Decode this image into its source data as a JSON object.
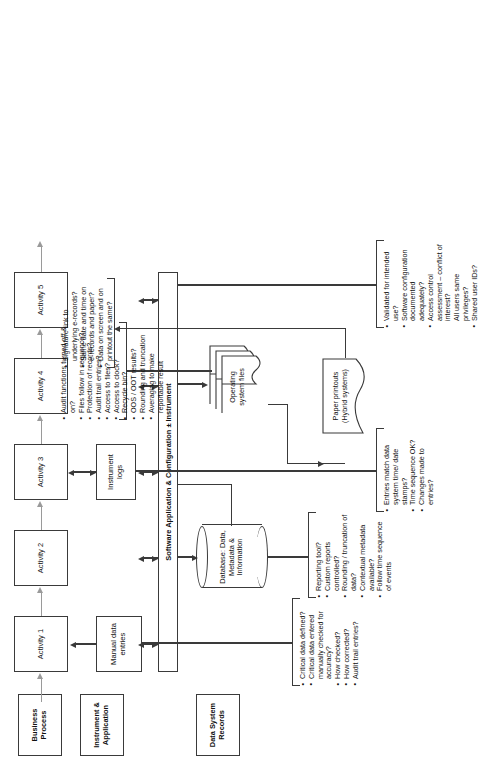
{
  "diagram": {
    "orientation": "rotated-90-ccw"
  },
  "lanes": [
    {
      "id": "business-process",
      "label": "Business Process"
    },
    {
      "id": "instrument-application",
      "label": "Instrument & Application"
    },
    {
      "id": "data-system-records",
      "label": "Data System Records"
    }
  ],
  "activities": [
    {
      "id": "activity-1",
      "label": "Activity 1"
    },
    {
      "id": "activity-2",
      "label": "Activity 2"
    },
    {
      "id": "activity-3",
      "label": "Activity 3"
    },
    {
      "id": "activity-4",
      "label": "Activity 4"
    },
    {
      "id": "activity-5",
      "label": "Activity 5"
    }
  ],
  "nodes": {
    "manual_data_entries": "Manual data entries",
    "instrument_logs": "Instrument logs",
    "software_bar": "Software Application & Configuration ± Instrument",
    "database": "Database: Data, Metadata & Information",
    "os_files": "Operating system files",
    "paper_printouts": "Paper printouts (Hybrid systems)"
  },
  "callouts": {
    "manual_entries": {
      "id": "callout-manual-entries",
      "items": [
        "Critical data defined?",
        "Critical data entered manually checked for accuracy?",
        "How checked?",
        "How corrected?",
        "Audit trail entries?"
      ]
    },
    "instrument_logs": {
      "id": "callout-instrument-logs",
      "items": [
        "Entries match data system time/ date stamps?",
        "Time sequence OK?",
        "Changes made to entries?"
      ]
    },
    "software": {
      "id": "callout-software",
      "items": [
        "Validated for intended use?",
        "Software configuration documented adequately?",
        "Access control assessment – conflict of interest?",
        "All users same privileges?",
        "Shared user IDs?"
      ]
    },
    "os_files": {
      "id": "callout-os-files",
      "items": [
        "Audit functions turned off & on?",
        "Files follow in sequence?",
        "Protection of records?",
        "Audit trail entries?",
        "Access to files?",
        "Access to clock?",
        "Recycle bin?",
        "OOS / OOT results?",
        "Rounding and truncation",
        "Averaging to make reportable result"
      ]
    },
    "database": {
      "id": "callout-database",
      "items": [
        "Reporting tool?",
        "Custom reports controlled?",
        "Rounding / truncation of data?",
        "Contextual metadata available?",
        "Follow time sequence of events"
      ]
    },
    "paper": {
      "id": "callout-paper",
      "items": [
        "Signature link to underlying e-records?",
        "Same date and time on e-records and paper?",
        "Data on screen and on printout the same?"
      ]
    }
  },
  "colors": {
    "stroke": "#3a3a3a",
    "text": "#111111",
    "background": "#ffffff"
  }
}
